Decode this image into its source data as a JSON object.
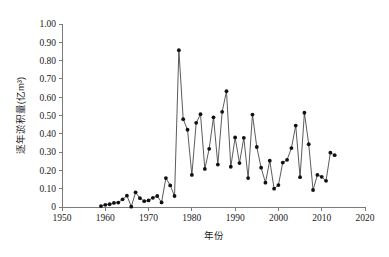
{
  "chart_data": {
    "type": "line",
    "title": "",
    "xlabel": "年份",
    "ylabel": "逐年淤积量(亿m³)",
    "xlim": [
      1950,
      2020
    ],
    "ylim": [
      0,
      1.0
    ],
    "xticks": [
      "1950",
      "1960",
      "1970",
      "1980",
      "1990",
      "2000",
      "2010",
      "2020"
    ],
    "xtick_values": [
      1950,
      1960,
      1970,
      1980,
      1990,
      2000,
      2010,
      2020
    ],
    "yticks": [
      "0",
      "0.10",
      "0.20",
      "0.30",
      "0.40",
      "0.50",
      "0.60",
      "0.70",
      "0.80",
      "0.90",
      "1.00"
    ],
    "ytick_values": [
      0,
      0.1,
      0.2,
      0.3,
      0.4,
      0.5,
      0.6,
      0.7,
      0.8,
      0.9,
      1.0
    ],
    "grid": false,
    "legend": null,
    "marker": "filled-circle",
    "line_color": "#3d3d3d",
    "marker_color": "#111111",
    "x": [
      1959,
      1960,
      1961,
      1962,
      1963,
      1964,
      1965,
      1966,
      1967,
      1968,
      1969,
      1970,
      1971,
      1972,
      1973,
      1974,
      1975,
      1976,
      1977,
      1978,
      1979,
      1980,
      1981,
      1982,
      1983,
      1984,
      1985,
      1986,
      1987,
      1988,
      1989,
      1990,
      1991,
      1992,
      1993,
      1994,
      1995,
      1996,
      1997,
      1998,
      1999,
      2000,
      2001,
      2002,
      2003,
      2004,
      2005,
      2006,
      2007,
      2008,
      2009,
      2010,
      2011,
      2012,
      2013
    ],
    "values": [
      0.005,
      0.012,
      0.015,
      0.022,
      0.024,
      0.042,
      0.062,
      0.002,
      0.08,
      0.048,
      0.032,
      0.036,
      0.05,
      0.06,
      0.025,
      0.158,
      0.118,
      0.06,
      0.857,
      0.48,
      0.422,
      0.175,
      0.46,
      0.507,
      0.208,
      0.318,
      0.49,
      0.232,
      0.52,
      0.633,
      0.22,
      0.38,
      0.24,
      0.378,
      0.158,
      0.505,
      0.328,
      0.215,
      0.133,
      0.253,
      0.1,
      0.12,
      0.243,
      0.258,
      0.322,
      0.445,
      0.163,
      0.515,
      0.343,
      0.093,
      0.175,
      0.165,
      0.143,
      0.297,
      0.283
    ],
    "series": [
      {
        "name": "逐年淤积量",
        "values": [
          0.005,
          0.012,
          0.015,
          0.022,
          0.024,
          0.042,
          0.062,
          0.002,
          0.08,
          0.048,
          0.032,
          0.036,
          0.05,
          0.06,
          0.025,
          0.158,
          0.118,
          0.06,
          0.857,
          0.48,
          0.422,
          0.175,
          0.46,
          0.507,
          0.208,
          0.318,
          0.49,
          0.232,
          0.52,
          0.633,
          0.22,
          0.38,
          0.24,
          0.378,
          0.158,
          0.505,
          0.328,
          0.215,
          0.133,
          0.253,
          0.1,
          0.12,
          0.243,
          0.258,
          0.322,
          0.445,
          0.163,
          0.515,
          0.343,
          0.093,
          0.175,
          0.165,
          0.143,
          0.297,
          0.283
        ]
      }
    ]
  }
}
